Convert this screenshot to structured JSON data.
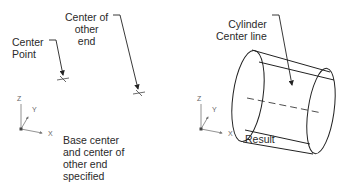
{
  "left_panel": {
    "label_center_point": "Center\nPoint",
    "label_center_other_end": "Center of\nother\nend",
    "caption": "Base center\nand center of\nother end\nspecified",
    "axes": {
      "z": "Z",
      "y": "Y",
      "x": "X"
    }
  },
  "right_panel": {
    "label_centerline": "Cylinder\nCenter line",
    "caption": "Result",
    "axes": {
      "z": "Z",
      "y": "Y",
      "x": "X"
    }
  },
  "colors": {
    "line": "#222222",
    "text": "#2a2a2a",
    "axis": "#666666"
  }
}
